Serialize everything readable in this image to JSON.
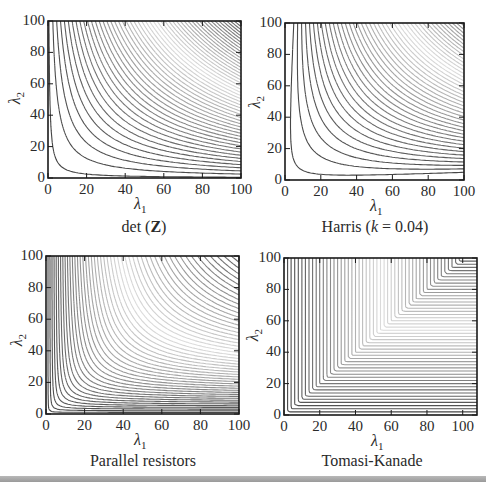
{
  "figure": {
    "bottom_bar_color": "#a8a8a8"
  },
  "chart_data": [
    {
      "type": "contour",
      "id": "det",
      "caption_prefix": "det (",
      "caption_bold": "Z",
      "caption_suffix": ")",
      "title": "det (Z)",
      "xlabel": "λ1",
      "ylabel": "λ2",
      "xlim": [
        0,
        100
      ],
      "ylim": [
        0,
        100
      ],
      "xticks": [
        0,
        20,
        40,
        60,
        80,
        100
      ],
      "yticks": [
        0,
        20,
        40,
        60,
        80,
        100
      ],
      "xtick_labels": [
        "0",
        "20",
        "40",
        "60",
        "80",
        "100"
      ],
      "ytick_labels": [
        "0",
        "20",
        "40",
        "60",
        "80",
        "100"
      ],
      "function": "λ1*λ2",
      "contour_levels": {
        "start": 50,
        "step": 200,
        "count": 50
      },
      "box": {
        "left": 48,
        "top": 21,
        "right": 241,
        "bottom": 178
      }
    },
    {
      "type": "contour",
      "id": "harris",
      "caption_prefix": "Harris (",
      "caption_italic": "k",
      "caption_suffix": " = 0.04)",
      "title": "Harris (k = 0.04)",
      "xlabel": "λ1",
      "ylabel": "λ2",
      "xlim": [
        0,
        100
      ],
      "ylim": [
        0,
        100
      ],
      "xticks": [
        0,
        20,
        40,
        60,
        80,
        100
      ],
      "yticks": [
        0,
        20,
        40,
        60,
        80,
        100
      ],
      "xtick_labels": [
        "0",
        "20",
        "40",
        "60",
        "80",
        "100"
      ],
      "ytick_labels": [
        "0",
        "20",
        "40",
        "60",
        "80",
        "100"
      ],
      "function": "λ1*λ2 - 0.04*(λ1+λ2)^2",
      "k": 0.04,
      "contour_levels": {
        "start": 50,
        "step": 200,
        "count": 50
      },
      "box": {
        "left": 285,
        "top": 23,
        "right": 464,
        "bottom": 180
      }
    },
    {
      "type": "contour",
      "id": "parallel",
      "caption_prefix": "Parallel resistors",
      "title": "Parallel resistors",
      "xlabel": "λ1",
      "ylabel": "λ2",
      "xlim": [
        0,
        100
      ],
      "ylim": [
        0,
        100
      ],
      "xticks": [
        0,
        20,
        40,
        60,
        80,
        100
      ],
      "yticks": [
        0,
        20,
        40,
        60,
        80,
        100
      ],
      "xtick_labels": [
        "0",
        "20",
        "40",
        "60",
        "80",
        "100"
      ],
      "ytick_labels": [
        "0",
        "20",
        "40",
        "60",
        "80",
        "100"
      ],
      "function": "λ1*λ2/(λ1+λ2)",
      "contour_levels": {
        "start": 1,
        "step": 1,
        "count": 50
      },
      "box": {
        "left": 46,
        "top": 256,
        "right": 239,
        "bottom": 414
      }
    },
    {
      "type": "contour",
      "id": "tomasi",
      "caption_prefix": "Tomasi-Kanade",
      "title": "Tomasi-Kanade",
      "xlabel": "λ1",
      "ylabel": "λ2",
      "xlim": [
        0,
        108
      ],
      "ylim": [
        0,
        100
      ],
      "xticks": [
        0,
        20,
        40,
        60,
        80,
        100
      ],
      "yticks": [
        0,
        20,
        40,
        60,
        80,
        100
      ],
      "xtick_labels": [
        "0",
        "20",
        "40",
        "60",
        "80",
        "100"
      ],
      "ytick_labels": [
        "0",
        "20",
        "40",
        "60",
        "80",
        "100"
      ],
      "function": "min(λ1, λ2)",
      "contour_levels": {
        "start": 2,
        "step": 2,
        "count": 49
      },
      "box": {
        "left": 284,
        "top": 258,
        "right": 477,
        "bottom": 415
      }
    }
  ]
}
